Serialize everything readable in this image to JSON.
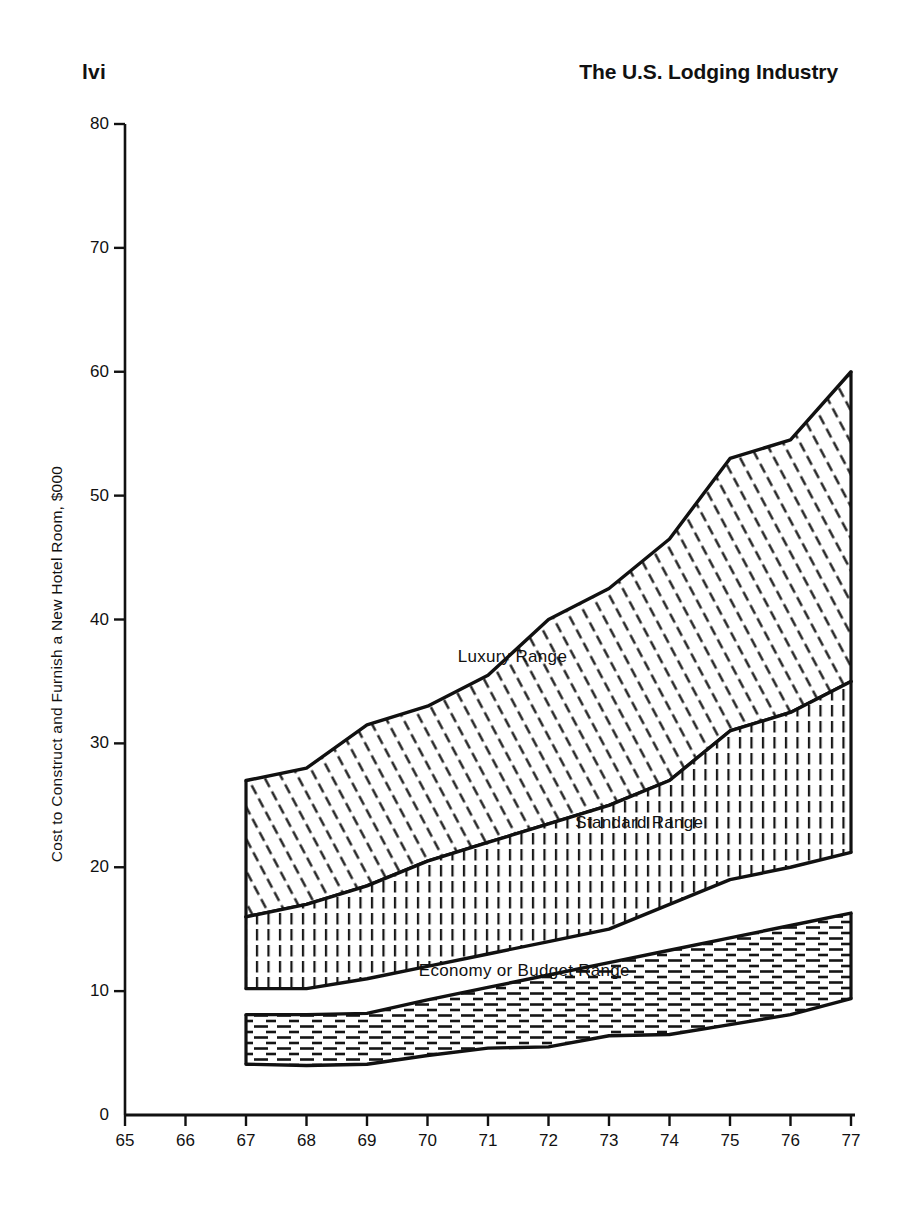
{
  "header": {
    "folio": "lvi",
    "running_head": "The U.S. Lodging Industry"
  },
  "chart_data": {
    "type": "area",
    "title": "",
    "xlabel": "",
    "ylabel": "Cost to Construct and Furnish a New Hotel Room, $000",
    "xlim": [
      65,
      77
    ],
    "ylim": [
      0,
      80
    ],
    "grid": false,
    "legend_position": "inline-annotations",
    "x_tick_labels": [
      "65",
      "66",
      "67",
      "68",
      "69",
      "70",
      "71",
      "72",
      "73",
      "74",
      "75",
      "76",
      "77"
    ],
    "y_tick_labels": [
      "0",
      "10",
      "20",
      "30",
      "40",
      "50",
      "60",
      "70",
      "80"
    ],
    "x": [
      67,
      68,
      69,
      70,
      71,
      72,
      73,
      74,
      75,
      76,
      77
    ],
    "bands": [
      {
        "name": "Luxury Range",
        "label": "Luxury Range",
        "fill_pattern": "diagonal-hatch",
        "upper": [
          27.0,
          28.0,
          31.5,
          33.0,
          35.5,
          40.0,
          42.5,
          46.5,
          53.0,
          54.5,
          60.0
        ],
        "lower": [
          16.0,
          17.0,
          18.5,
          20.5,
          22.0,
          23.5,
          25.0,
          27.0,
          31.0,
          32.5,
          35.0
        ]
      },
      {
        "name": "Standard Range",
        "label": "Standard Range",
        "fill_pattern": "vertical-hatch",
        "upper": [
          16.0,
          17.0,
          18.5,
          20.5,
          22.0,
          23.5,
          25.0,
          27.0,
          31.0,
          32.5,
          35.0
        ],
        "lower": [
          10.2,
          10.2,
          11.0,
          12.0,
          13.0,
          14.0,
          15.0,
          17.0,
          19.0,
          20.0,
          21.2
        ]
      },
      {
        "name": "Economy or Budget Range",
        "label": "Economy or Budget Range",
        "fill_pattern": "horizontal-dash-hatch",
        "upper": [
          8.1,
          8.1,
          8.2,
          9.3,
          10.3,
          11.3,
          12.3,
          13.3,
          14.3,
          15.3,
          16.3
        ],
        "lower": [
          4.1,
          4.0,
          4.1,
          4.8,
          5.4,
          5.5,
          6.4,
          6.5,
          7.3,
          8.1,
          9.4
        ]
      }
    ],
    "annotations": [
      {
        "text": "Luxury Range",
        "x": 71.4,
        "y": 37.0
      },
      {
        "text": "Standard Range",
        "x": 73.5,
        "y": 23.6
      },
      {
        "text": "Economy or Budget Range",
        "x": 71.6,
        "y": 11.6
      }
    ],
    "colors": {
      "ink": "#111111",
      "background": "#ffffff"
    }
  }
}
